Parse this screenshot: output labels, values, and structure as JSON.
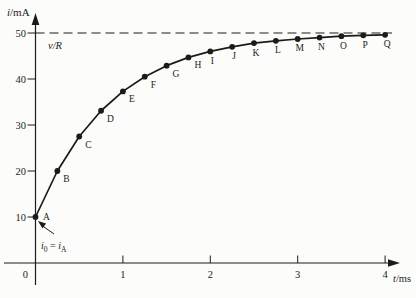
{
  "chart_data": {
    "type": "line",
    "title": "",
    "x": [
      0,
      0.25,
      0.5,
      0.75,
      1.0,
      1.25,
      1.5,
      1.75,
      2.0,
      2.25,
      2.5,
      2.75,
      3.0,
      3.25,
      3.5,
      3.75,
      4.0
    ],
    "series": [
      {
        "name": "i",
        "values": [
          10.0,
          20.0,
          27.5,
          33.1,
          37.3,
          40.5,
          42.9,
          44.7,
          46.0,
          47.0,
          47.8,
          48.3,
          48.7,
          49.0,
          49.3,
          49.5,
          49.6
        ]
      }
    ],
    "point_labels": [
      "A",
      "B",
      "C",
      "D",
      "E",
      "F",
      "G",
      "H",
      "I",
      "J",
      "K",
      "L",
      "M",
      "N",
      "O",
      "P",
      "Q"
    ],
    "xlabel": "t/ms",
    "ylabel": "i/mA",
    "xlabel_parts": [
      {
        "t": "t",
        "i": true
      },
      {
        "t": "/ms"
      }
    ],
    "ylabel_parts": [
      {
        "t": "i",
        "i": true
      },
      {
        "t": "/mA"
      }
    ],
    "xlim": [
      0,
      4
    ],
    "ylim": [
      0,
      50
    ],
    "x_ticks": [
      1,
      2,
      3,
      4
    ],
    "y_ticks": [
      10,
      20,
      30,
      40,
      50
    ],
    "origin_label": "0",
    "grid": false,
    "legend": "none",
    "asymptote": {
      "value": 50,
      "label": "v/R",
      "label_parts": [
        {
          "t": "v/R",
          "i": true
        }
      ],
      "line_style": "dashed"
    },
    "annotation": {
      "text": "i0 = iA",
      "text_parts": [
        {
          "t": "i",
          "i": true
        },
        {
          "t": "0",
          "sub": true
        },
        {
          "t": " = "
        },
        {
          "t": "i",
          "i": true
        },
        {
          "t": "A",
          "sub": true
        }
      ],
      "points_to": "A"
    },
    "colors": {
      "line": "#1b1b1b",
      "text": "#1b1b1b",
      "background": "#fcfcfa"
    }
  }
}
